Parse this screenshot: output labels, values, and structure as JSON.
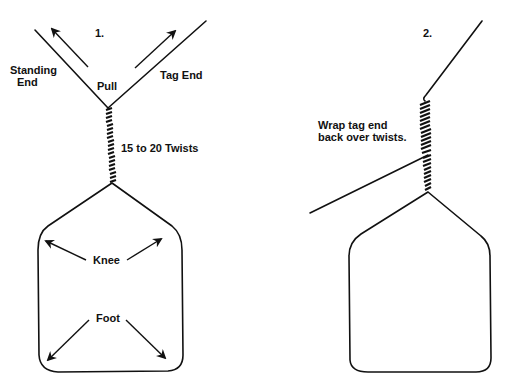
{
  "diagram": {
    "panel1": {
      "step_number": "1.",
      "labels": {
        "standing_end_line1": "Standing",
        "standing_end_line2": "End",
        "pull": "Pull",
        "tag_end": "Tag End",
        "twists": "15 to 20 Twists",
        "knee": "Knee",
        "foot": "Foot"
      }
    },
    "panel2": {
      "step_number": "2.",
      "labels": {
        "instruction_line1": "Wrap tag end",
        "instruction_line2": "back over twists."
      }
    },
    "colors": {
      "ink": "#111111",
      "background": "#ffffff"
    }
  }
}
